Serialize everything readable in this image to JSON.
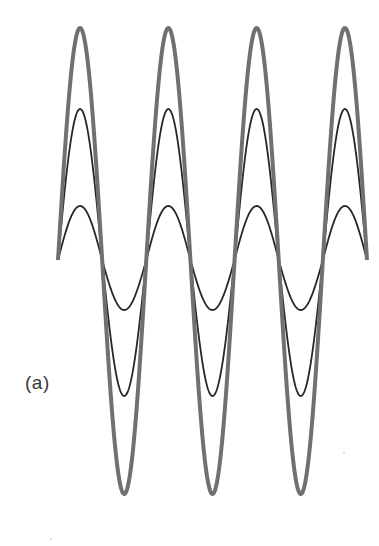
{
  "figure": {
    "panel_label": "(a)",
    "background": "#ffffff"
  },
  "diagram": {
    "type": "superimposed-sine-waves",
    "baseline_y": 260,
    "start_x": 58,
    "end_x": 367,
    "period_px": 88.3,
    "cycles": 3.5,
    "waves": [
      {
        "name": "resultant-wave",
        "stroke": "#707070",
        "stroke_width": 4,
        "amplitude_up": 232,
        "amplitude_down": 234
      },
      {
        "name": "component-wave-medium",
        "stroke": "#262626",
        "stroke_width": 1.8,
        "amplitude_up": 151,
        "amplitude_down": 136
      },
      {
        "name": "component-wave-small",
        "stroke": "#262626",
        "stroke_width": 1.8,
        "amplitude_up": 54,
        "amplitude_down": 50
      }
    ],
    "peaks_x": [
      80,
      168,
      257,
      346
    ],
    "troughs_x": [
      124,
      213,
      301
    ]
  }
}
